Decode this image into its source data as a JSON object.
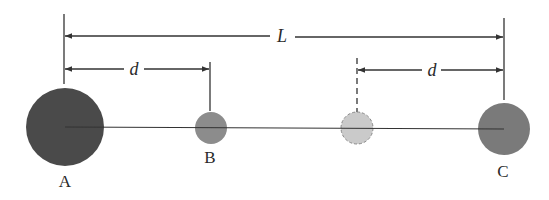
{
  "diagram": {
    "type": "spheres-on-a-line",
    "dimensions": {
      "total_length_label": "L",
      "left_spacing_label": "d",
      "right_spacing_label": "d"
    },
    "spheres": [
      {
        "label": "A",
        "cx": 65,
        "cy": 127,
        "r": 39,
        "fill": "#4a4a4a",
        "style": "solid"
      },
      {
        "label": "B",
        "cx": 211,
        "cy": 128,
        "r": 16,
        "fill": "#8c8c8c",
        "style": "solid"
      },
      {
        "label": "",
        "cx": 357,
        "cy": 128,
        "r": 16,
        "fill": "#c8c8c8",
        "style": "dashed"
      },
      {
        "label": "C",
        "cx": 504,
        "cy": 129,
        "r": 26,
        "fill": "#7a7a7a",
        "style": "solid"
      }
    ],
    "colors": {
      "line": "#333333",
      "sphere_a": "#4a4a4a",
      "sphere_b": "#8c8c8c",
      "ghost": "#c8c8c8",
      "sphere_c": "#7a7a7a"
    }
  }
}
